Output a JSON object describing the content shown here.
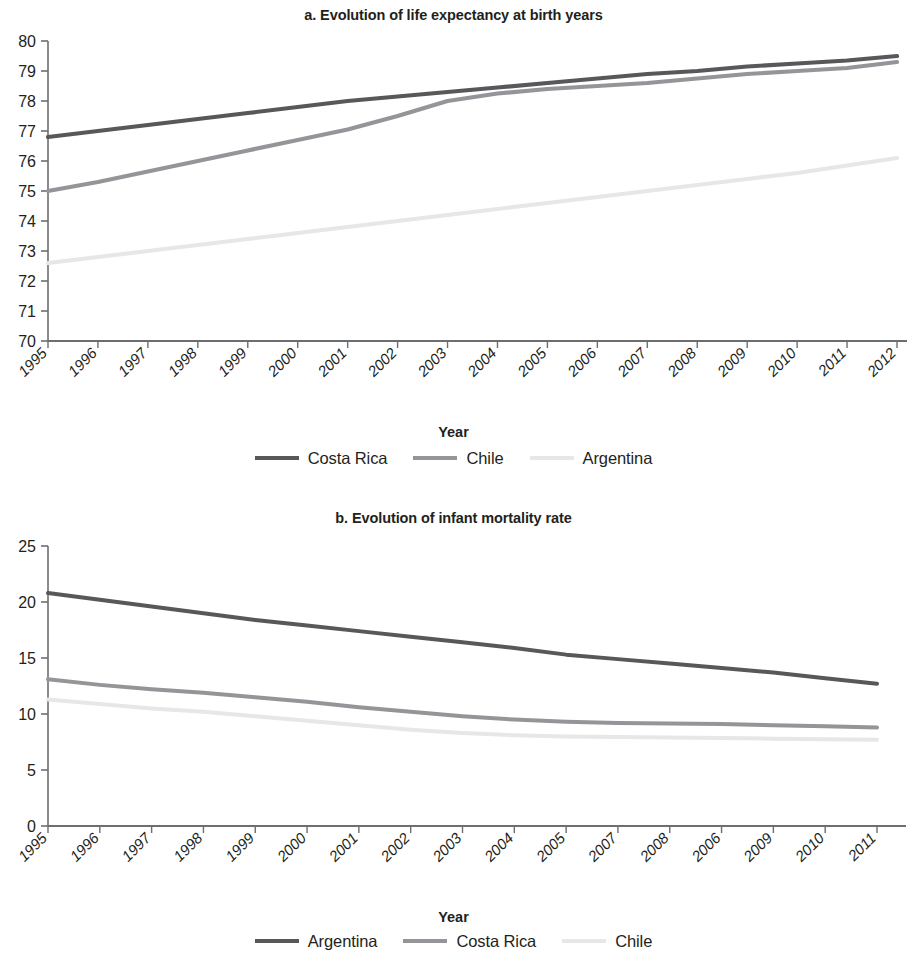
{
  "figure_a": {
    "title": "a. Evolution of life expectancy at birth years",
    "xlabel": "Year",
    "legend": [
      {
        "label": "Costa Rica",
        "color": "#58585b"
      },
      {
        "label": "Chile",
        "color": "#939598"
      },
      {
        "label": "Argentina",
        "color": "#e6e7e8"
      }
    ]
  },
  "figure_b": {
    "title": "b. Evolution of infant mortality rate",
    "xlabel": "Year",
    "legend": [
      {
        "label": "Argentina",
        "color": "#58585b"
      },
      {
        "label": "Costa Rica",
        "color": "#939598"
      },
      {
        "label": "Chile",
        "color": "#e6e7e8"
      }
    ]
  },
  "chart_data": [
    {
      "type": "line",
      "title": "a. Evolution of life expectancy at birth years",
      "xlabel": "Year",
      "ylabel": "",
      "categories": [
        "1995",
        "1996",
        "1997",
        "1998",
        "1999",
        "2000",
        "2001",
        "2002",
        "2003",
        "2004",
        "2005",
        "2006",
        "2007",
        "2008",
        "2009",
        "2010",
        "2011",
        "2012"
      ],
      "ylim": [
        70,
        80
      ],
      "yticks": [
        70,
        71,
        72,
        73,
        74,
        75,
        76,
        77,
        78,
        79,
        80
      ],
      "grid": false,
      "legend_position": "bottom",
      "series": [
        {
          "name": "Costa Rica",
          "color": "#58585b",
          "values": [
            76.8,
            77.0,
            77.2,
            77.4,
            77.6,
            77.8,
            78.0,
            78.15,
            78.3,
            78.45,
            78.6,
            78.75,
            78.9,
            79.0,
            79.15,
            79.25,
            79.35,
            79.5
          ]
        },
        {
          "name": "Chile",
          "color": "#939598",
          "values": [
            75.0,
            75.3,
            75.65,
            76.0,
            76.35,
            76.7,
            77.05,
            77.5,
            78.0,
            78.25,
            78.4,
            78.5,
            78.6,
            78.75,
            78.9,
            79.0,
            79.1,
            79.3
          ]
        },
        {
          "name": "Argentina",
          "color": "#e6e7e8",
          "values": [
            72.6,
            72.8,
            73.0,
            73.2,
            73.4,
            73.6,
            73.8,
            74.0,
            74.2,
            74.4,
            74.6,
            74.8,
            75.0,
            75.2,
            75.4,
            75.6,
            75.85,
            76.1
          ]
        }
      ]
    },
    {
      "type": "line",
      "title": "b. Evolution of infant mortality rate",
      "xlabel": "Year",
      "ylabel": "",
      "categories": [
        "1995",
        "1996",
        "1997",
        "1998",
        "1999",
        "2000",
        "2001",
        "2002",
        "2003",
        "2004",
        "2005",
        "2007",
        "2008",
        "2006",
        "2009",
        "2010",
        "2011"
      ],
      "ylim": [
        0,
        25
      ],
      "yticks": [
        0,
        5,
        10,
        15,
        20,
        25
      ],
      "grid": false,
      "legend_position": "bottom",
      "series": [
        {
          "name": "Argentina",
          "color": "#58585b",
          "values": [
            20.8,
            20.2,
            19.6,
            19.0,
            18.4,
            17.9,
            17.4,
            16.9,
            16.4,
            15.9,
            15.3,
            14.9,
            14.5,
            14.1,
            13.7,
            13.2,
            12.7
          ]
        },
        {
          "name": "Costa Rica",
          "color": "#939598",
          "values": [
            13.1,
            12.6,
            12.2,
            11.9,
            11.5,
            11.1,
            10.6,
            10.2,
            9.8,
            9.5,
            9.3,
            9.2,
            9.15,
            9.1,
            9.0,
            8.9,
            8.8
          ]
        },
        {
          "name": "Chile",
          "color": "#e6e7e8",
          "values": [
            11.3,
            10.9,
            10.5,
            10.2,
            9.8,
            9.4,
            9.0,
            8.6,
            8.3,
            8.1,
            8.0,
            7.95,
            7.9,
            7.85,
            7.8,
            7.75,
            7.7
          ]
        }
      ]
    }
  ]
}
